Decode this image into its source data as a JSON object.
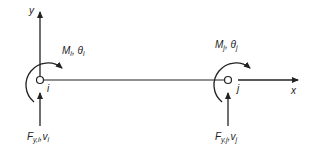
{
  "diagram": {
    "type": "beam-element-dof",
    "axes": {
      "y_label": "y",
      "x_label": "x"
    },
    "nodes": [
      {
        "id": "i",
        "label": "i",
        "x": 40,
        "y": 80,
        "moment": {
          "M": "M",
          "M_sub": "i",
          "theta": "θ",
          "theta_sub": "i",
          "sep": ", "
        },
        "force": {
          "F": "F",
          "F_sub": "y,i",
          "v": "v",
          "v_sub": "i",
          "sep": ","
        }
      },
      {
        "id": "j",
        "label": "j",
        "x": 228,
        "y": 80,
        "moment": {
          "M": "M",
          "M_sub": "j",
          "theta": "θ",
          "theta_sub": "j",
          "sep": ", "
        },
        "force": {
          "F": "F",
          "F_sub": "y,j",
          "v": "v",
          "v_sub": "j",
          "sep": ","
        }
      }
    ],
    "colors": {
      "line": "#222222",
      "background": "#ffffff"
    }
  }
}
